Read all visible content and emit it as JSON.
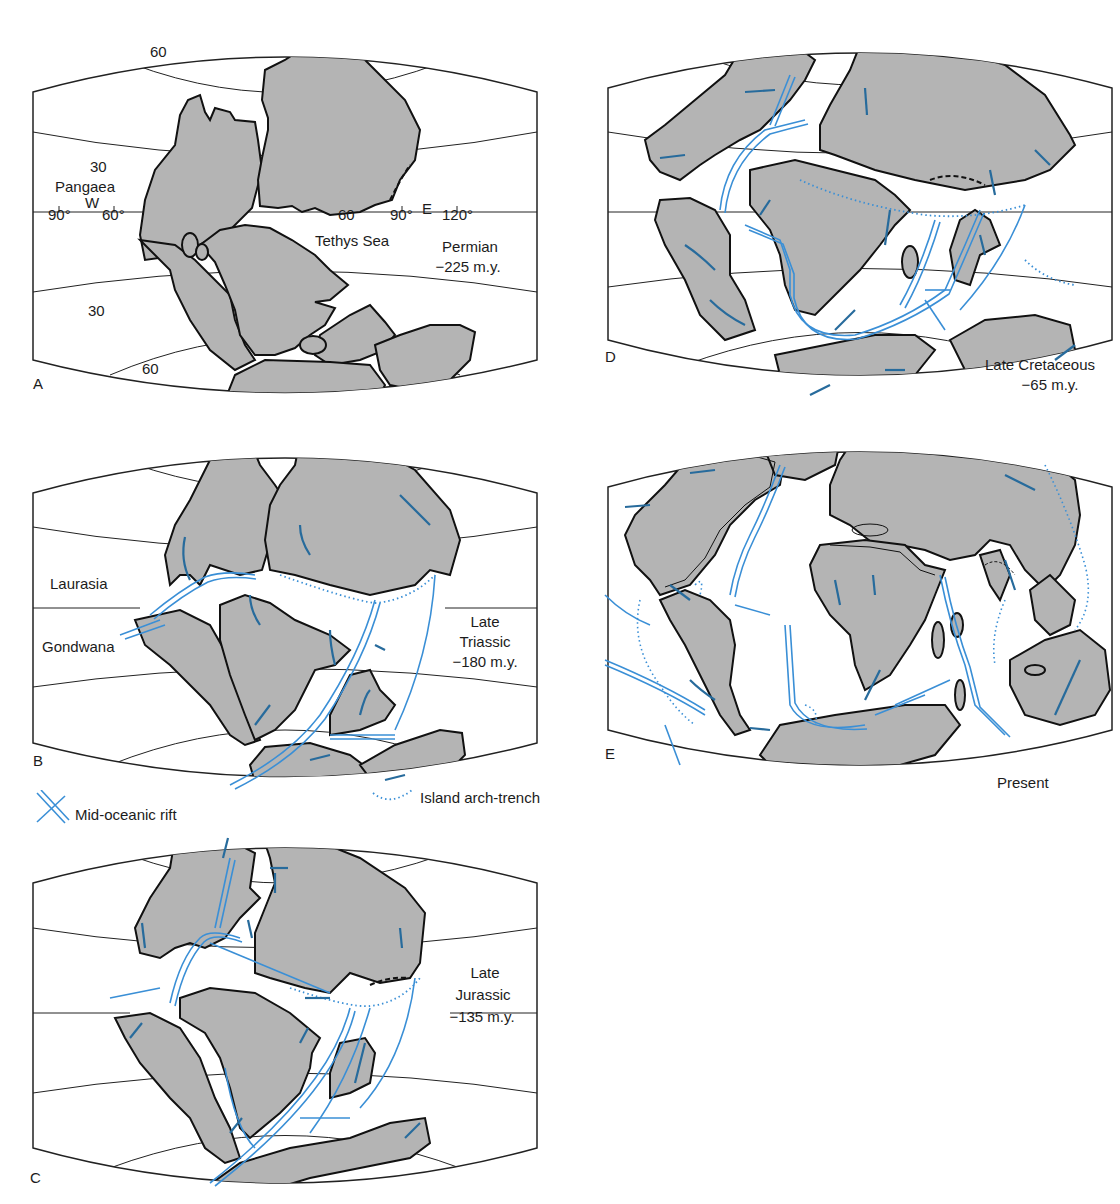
{
  "figure": {
    "colors": {
      "land": "#b4b4b4",
      "outline": "#111111",
      "rift": "#3a8fd6",
      "arrow": "#276b9c",
      "trench": "#3a8fd6",
      "graticule": "#222222"
    }
  },
  "panels": {
    "A": {
      "letter": "A",
      "period": "Permian",
      "age": "−225 m.y.",
      "supercontinent": "Pangaea",
      "sea": "Tethys Sea",
      "hemisphere_w": "W",
      "hemisphere_e": "E",
      "lat_labels": [
        "60",
        "30",
        "30",
        "60"
      ],
      "lon_labels": [
        "90°",
        "60°",
        "60",
        "90°",
        "120°"
      ]
    },
    "B": {
      "letter": "B",
      "period_line1": "Late",
      "period_line2": "Triassic",
      "age": "−180 m.y.",
      "north_mass": "Laurasia",
      "south_mass": "Gondwana"
    },
    "C": {
      "letter": "C",
      "period_line1": "Late",
      "period_line2": "Jurassic",
      "age": "−135 m.y."
    },
    "D": {
      "letter": "D",
      "period": "Late Cretaceous",
      "age": "−65 m.y."
    },
    "E": {
      "letter": "E",
      "period": "Present"
    }
  },
  "legend": {
    "rift": {
      "icon": "mid-ocean-rift-symbol",
      "label": "Mid-oceanic rift"
    },
    "trench": {
      "icon": "dotted-arc-symbol",
      "label": "Island arch-trench"
    }
  }
}
